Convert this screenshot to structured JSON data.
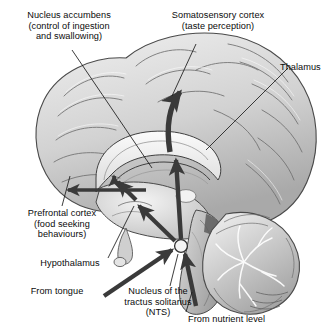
{
  "figure": {
    "background_color": "#ffffff",
    "text_color": "#0b0b0b",
    "arrow_color": "#3a3a3a",
    "leader_color": "#1a1a1a",
    "brain_tone_light": "#e8e8e8",
    "brain_tone_mid": "#b9b9b9",
    "brain_tone_dark": "#6e6e6e"
  },
  "labels": {
    "nucleus_accumbens": {
      "lines": [
        "Nucleus accumbens",
        "(control of ingestion",
        "and swallowing)"
      ],
      "text": "Nucleus accumbens\n(control of ingestion\nand swallowing)"
    },
    "somatosensory_cortex": {
      "lines": [
        "Somatosensory cortex",
        "(taste perception)"
      ],
      "text": "Somatosensory cortex\n(taste perception)"
    },
    "thalamus": {
      "text": "Thalamus"
    },
    "prefrontal_cortex": {
      "lines": [
        "Prefrontal cortex",
        "(food seeking",
        "behaviours)"
      ],
      "text": "Prefrontal cortex\n(food seeking\nbehaviours)"
    },
    "hypothalamus": {
      "text": "Hypothalamus"
    },
    "from_tongue": {
      "text": "From tongue"
    },
    "nts": {
      "lines": [
        "Nucleus of the",
        "tractus solitarius",
        "(NTS)"
      ],
      "text": "Nucleus of the\ntractus solitarius\n(NTS)"
    },
    "from_nutrient_level": {
      "text": "From nutrient level"
    }
  },
  "structures": [
    {
      "name": "cerebral-cortex",
      "tone": "#dcdcdc"
    },
    {
      "name": "corpus-callosum",
      "tone": "#f2f2f2"
    },
    {
      "name": "thalamus-body",
      "tone": "#d4d4d4"
    },
    {
      "name": "hypothalamus-body",
      "tone": "#c2c2c2"
    },
    {
      "name": "cerebellum",
      "tone": "#cfcfcf"
    },
    {
      "name": "brainstem",
      "tone": "#bdbdbd"
    },
    {
      "name": "nts-node",
      "tone": "#efefef"
    }
  ],
  "pathways": [
    {
      "name": "nts-to-thalamus-to-somatosensory-cortex",
      "direction": "up"
    },
    {
      "name": "nts-to-hypothalamus",
      "direction": "up-left"
    },
    {
      "name": "hypothalamus-to-nucleus-accumbens",
      "direction": "up-left"
    },
    {
      "name": "accumbens-to-prefrontal-cortex",
      "direction": "left"
    },
    {
      "name": "tongue-to-nts",
      "direction": "up-right"
    },
    {
      "name": "nutrient-level-to-nts",
      "direction": "up"
    }
  ]
}
